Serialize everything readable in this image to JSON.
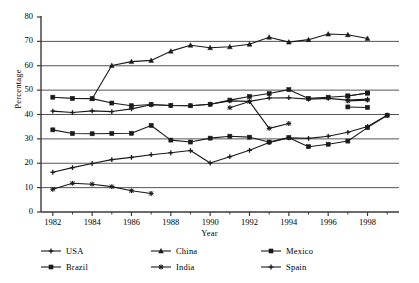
{
  "chart_data": {
    "type": "line",
    "title": "",
    "xlabel": "Year",
    "ylabel": "Percentage",
    "xlim": [
      1981.4,
      1999.6
    ],
    "ylim": [
      0,
      80
    ],
    "yticks": [
      0,
      10,
      20,
      30,
      40,
      50,
      60,
      70,
      80
    ],
    "xticks": [
      1982,
      1984,
      1986,
      1988,
      1990,
      1992,
      1994,
      1996,
      1998
    ],
    "xminorticks": [
      1983,
      1985,
      1987,
      1989,
      1991,
      1993,
      1995,
      1997,
      1999
    ],
    "grid": "horizontal",
    "legend_position": "below",
    "series": [
      {
        "name": "USA",
        "marker": "plus",
        "x": [
          1982,
          1983,
          1984,
          1985,
          1986,
          1987,
          1988,
          1989,
          1990,
          1991,
          1992,
          1993,
          1994,
          1995,
          1996,
          1997,
          1998
        ],
        "y": [
          41.4,
          40.8,
          41.5,
          41.2,
          42.3,
          44.0,
          43.7,
          43.6,
          44.2,
          45.6,
          45.4,
          46.8,
          46.9,
          46.3,
          46.6,
          45.9,
          46.3
        ]
      },
      {
        "name": "Brazil",
        "marker": "square",
        "x": [
          1982,
          1983,
          1984,
          1985,
          1986,
          1987,
          1988,
          1989,
          1990,
          1991,
          1992,
          1993,
          1994,
          1995,
          1996,
          1997,
          1998
        ],
        "y": [
          47.1,
          46.6,
          46.5,
          44.7,
          43.6,
          44.1,
          43.7,
          43.6,
          44.2,
          45.9,
          47.4,
          48.6,
          50.2,
          46.6,
          47.1,
          47.6,
          48.8
        ]
      },
      {
        "name": "China",
        "marker": "triangle",
        "x": [
          1984,
          1985,
          1986,
          1987,
          1988,
          1989,
          1990,
          1991,
          1992,
          1993,
          1994,
          1995,
          1996,
          1997,
          1998
        ],
        "y": [
          46.5,
          60.1,
          61.7,
          62.2,
          66.0,
          68.4,
          67.4,
          67.8,
          68.8,
          71.7,
          69.7,
          70.7,
          73.0,
          72.7,
          71.2
        ]
      },
      {
        "name": "India",
        "marker": "star",
        "x": [
          1982,
          1983,
          1984,
          1985,
          1986,
          1987
        ],
        "y": [
          9.3,
          11.8,
          11.4,
          10.4,
          8.7,
          7.6
        ]
      },
      {
        "name": "Mexico",
        "marker": "square",
        "x": [
          1982,
          1983,
          1984,
          1985,
          1986,
          1987,
          1988,
          1989,
          1990,
          1991,
          1992,
          1993,
          1994,
          1995,
          1996,
          1997,
          1998,
          1999
        ],
        "y": [
          33.7,
          32.2,
          32.1,
          32.2,
          32.3,
          35.5,
          29.5,
          28.7,
          30.3,
          31.1,
          30.7,
          28.7,
          30.5,
          26.8,
          27.8,
          29.1,
          34.6,
          39.7
        ]
      },
      {
        "name": "Spain",
        "marker": "plus",
        "x": [
          1982,
          1983,
          1984,
          1985,
          1986,
          1987,
          1988,
          1989,
          1990,
          1991,
          1992,
          1993,
          1994,
          1995,
          1996,
          1997,
          1998,
          1999
        ],
        "y": [
          16.3,
          18.2,
          19.9,
          21.5,
          22.4,
          23.5,
          24.3,
          25.2,
          20.1,
          22.7,
          25.3,
          28.5,
          30.4,
          30.2,
          31.1,
          32.7,
          35.1,
          39.7
        ]
      }
    ],
    "extra_series": [
      {
        "name": "India-tail",
        "marker": "star",
        "x": [
          1991,
          1992,
          1993,
          1994
        ],
        "y": [
          42.8,
          45.3,
          34.3,
          36.3
        ]
      },
      {
        "name": "India-right",
        "marker": "star",
        "x": [
          1997,
          1998
        ],
        "y": [
          45.6,
          45.9
        ]
      },
      {
        "name": "Mexico-right",
        "marker": "square",
        "x": [
          1997,
          1998
        ],
        "y": [
          43.1,
          42.9
        ]
      },
      {
        "name": "Brazil-right",
        "marker": "square",
        "x": [
          1997,
          1998
        ],
        "y": [
          47.6,
          48.8
        ]
      }
    ]
  },
  "axis": {
    "ylabel": "Percentage",
    "xlabel": "Year",
    "yticks": [
      "0",
      "10",
      "20",
      "30",
      "40",
      "50",
      "60",
      "70",
      "80"
    ],
    "xticks": [
      "1982",
      "1984",
      "1986",
      "1988",
      "1990",
      "1992",
      "1994",
      "1996",
      "1998"
    ]
  },
  "legend": {
    "items": [
      {
        "label": "USA",
        "marker": "plus"
      },
      {
        "label": "Brazil",
        "marker": "square"
      },
      {
        "label": "China",
        "marker": "triangle"
      },
      {
        "label": "India",
        "marker": "star"
      },
      {
        "label": "Mexico",
        "marker": "square"
      },
      {
        "label": "Spain",
        "marker": "plus"
      }
    ]
  },
  "style": {
    "line_color": "#1a1a1a",
    "grid_color": "#555555",
    "axis_color": "#3a3a3a",
    "background": "#ffffff"
  }
}
